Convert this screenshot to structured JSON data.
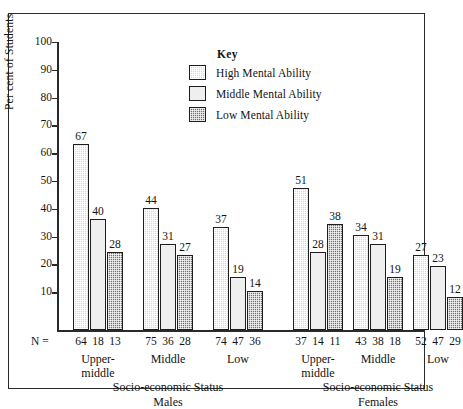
{
  "chart_data": {
    "type": "bar",
    "title": "",
    "xlabel": "Socio-economic Status",
    "ylabel": "Per cent of Students",
    "ylim": [
      0,
      100
    ],
    "yticks": [
      10,
      20,
      30,
      40,
      50,
      60,
      70,
      80,
      90,
      100
    ],
    "grid": false,
    "legend_position": "upper-center",
    "legend_title": "Key",
    "series": [
      {
        "name": "High Mental Ability",
        "values": [
          67,
          44,
          37,
          51,
          34,
          27
        ],
        "swatch": "#d7d7d7"
      },
      {
        "name": "Middle Mental Ability",
        "values": [
          40,
          31,
          19,
          28,
          31,
          23
        ],
        "swatch": "#efefef"
      },
      {
        "name": "Low Mental Ability",
        "values": [
          28,
          27,
          14,
          38,
          19,
          12
        ],
        "swatch": "#6e6e6e"
      }
    ],
    "categories": [
      "Upper-middle",
      "Middle",
      "Low",
      "Upper-middle",
      "Middle",
      "Low"
    ],
    "sample_sizes": [
      [
        64,
        18,
        13
      ],
      [
        75,
        36,
        28
      ],
      [
        74,
        47,
        36
      ],
      [
        37,
        14,
        11
      ],
      [
        43,
        38,
        18
      ],
      [
        52,
        47,
        29
      ]
    ],
    "n_prefix": "N =",
    "panels": [
      {
        "label": "Socio-economic Status",
        "sublabel": "Males"
      },
      {
        "label": "Socio-economic Status",
        "sublabel": "Females"
      }
    ]
  },
  "axis": {
    "y_label": "Per cent of Students",
    "ticks": [
      "100",
      "90",
      "80",
      "70",
      "60",
      "50",
      "40",
      "30",
      "20",
      "10"
    ]
  },
  "legend": {
    "title": "Key",
    "items": [
      {
        "label": "High Mental Ability"
      },
      {
        "label": "Middle Mental Ability"
      },
      {
        "label": "Low Mental Ability"
      }
    ]
  },
  "groups": [
    {
      "name_line1": "Upper-",
      "name_line2": "middle",
      "n": [
        "64",
        "18",
        "13"
      ]
    },
    {
      "name_line1": "Middle",
      "name_line2": "",
      "n": [
        "75",
        "36",
        "28"
      ]
    },
    {
      "name_line1": "Low",
      "name_line2": "",
      "n": [
        "74",
        "47",
        "36"
      ]
    },
    {
      "name_line1": "Upper-",
      "name_line2": "middle",
      "n": [
        "37",
        "14",
        "11"
      ]
    },
    {
      "name_line1": "Middle",
      "name_line2": "",
      "n": [
        "43",
        "38",
        "18"
      ]
    },
    {
      "name_line1": "Low",
      "name_line2": "",
      "n": [
        "52",
        "47",
        "29"
      ]
    }
  ],
  "bar_values": {
    "g0": [
      "67",
      "40",
      "28"
    ],
    "g1": [
      "44",
      "31",
      "27"
    ],
    "g2": [
      "37",
      "19",
      "14"
    ],
    "g3": [
      "51",
      "28",
      "38"
    ],
    "g4": [
      "34",
      "31",
      "19"
    ],
    "g5": [
      "27",
      "23",
      "12"
    ]
  },
  "footer": {
    "n_prefix": "N =",
    "males_status": "Socio-economic Status",
    "males_sub": "Males",
    "females_status": "Socio-economic Status",
    "females_sub": "Females"
  }
}
